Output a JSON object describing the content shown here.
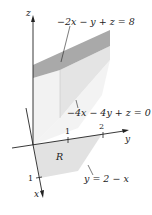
{
  "figure": {
    "axes": {
      "x_label": "x",
      "y_label": "y",
      "z_label": "z",
      "x_tick": "1",
      "y_ticks": [
        "1",
        "2"
      ]
    },
    "planes": {
      "top": "−2x − y + z = 8",
      "bottom": "−4x − 4y + z = 0"
    },
    "region": {
      "label": "R",
      "boundary": "y = 2 − x"
    },
    "colors": {
      "top_face": "#a8a8a8",
      "side_face": "#e6e6e6",
      "front_face": "#f0f0f0",
      "region_fill": "#e2e2e2",
      "line": "#222222"
    }
  }
}
